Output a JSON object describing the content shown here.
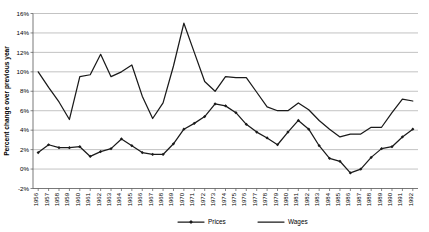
{
  "chart_data": {
    "type": "line",
    "title": "",
    "xlabel": "",
    "ylabel": "Percent change over previous year",
    "ylim": [
      -2,
      16
    ],
    "ytick_labels": [
      "16%",
      "14%",
      "12%",
      "10%",
      "8%",
      "6%",
      "4%",
      "2%",
      "0%",
      "-2%"
    ],
    "ytick_values": [
      16,
      14,
      12,
      10,
      8,
      6,
      4,
      2,
      0,
      -2
    ],
    "grid": true,
    "legend_position": "bottom",
    "categories": [
      "1956",
      "1957",
      "1958",
      "1959",
      "1960",
      "1961",
      "1962",
      "1963",
      "1964",
      "1965",
      "1966",
      "1967",
      "1968",
      "1969",
      "1970",
      "1971",
      "1972",
      "1973",
      "1974",
      "1975",
      "1976",
      "1977",
      "1978",
      "1979",
      "1980",
      "1981",
      "1982",
      "1983",
      "1984",
      "1985",
      "1986",
      "1987",
      "1988",
      "1989",
      "1990",
      "1991",
      "1992"
    ],
    "series": [
      {
        "name": "Prices",
        "marker": "diamond",
        "values": [
          1.7,
          2.5,
          2.2,
          2.2,
          2.3,
          1.3,
          1.8,
          2.1,
          3.1,
          2.4,
          1.7,
          1.5,
          1.5,
          2.6,
          4.1,
          4.7,
          5.4,
          6.7,
          6.5,
          5.8,
          4.6,
          3.8,
          3.2,
          2.5,
          3.8,
          5.0,
          4.1,
          2.4,
          1.1,
          0.8,
          -0.4,
          0.0,
          1.2,
          2.1,
          2.3,
          3.3,
          4.1
        ]
      },
      {
        "name": "Wages",
        "marker": "none",
        "values": [
          10.0,
          8.4,
          6.9,
          5.1,
          9.5,
          9.7,
          11.8,
          9.5,
          10.0,
          10.7,
          7.5,
          5.2,
          6.8,
          10.6,
          15.0,
          12.0,
          9.0,
          8.0,
          9.5,
          9.4,
          9.4,
          7.9,
          6.4,
          6.0,
          6.0,
          6.8,
          6.1,
          5.0,
          4.1,
          3.3,
          3.6,
          3.6,
          4.3,
          4.3,
          5.8,
          7.2,
          7.0
        ]
      }
    ],
    "legend": [
      {
        "label": "Prices",
        "marker": "diamond"
      },
      {
        "label": "Wages",
        "marker": "none"
      }
    ]
  }
}
